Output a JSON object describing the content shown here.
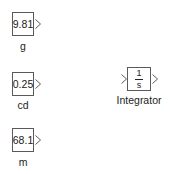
{
  "diagram": {
    "blocks": [
      {
        "id": "g",
        "type": "Constant",
        "value": "9.81",
        "label": "g"
      },
      {
        "id": "cd",
        "type": "Constant",
        "value": "0.25",
        "label": "cd"
      },
      {
        "id": "m",
        "type": "Constant",
        "value": "68.1",
        "label": "m"
      },
      {
        "id": "integrator",
        "type": "Integrator",
        "numerator": "1",
        "denominator": "s",
        "label": "Integrator"
      }
    ],
    "colors": {
      "block_border": "#5a5a5a",
      "port_arrow": "#5a5a5a",
      "text": "#222222",
      "background": "#ffffff"
    }
  }
}
